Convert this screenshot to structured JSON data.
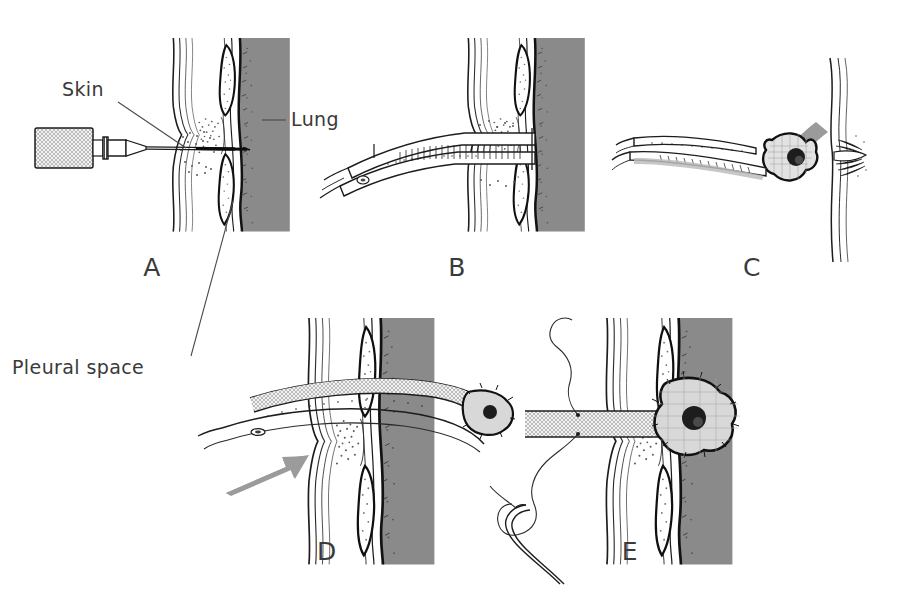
{
  "figure": {
    "background_color": "#ffffff",
    "width": 904,
    "height": 593
  },
  "colors": {
    "lung_fill": "#8a8a8a",
    "arrow_gray": "#9b9b9b",
    "ink": "#1c1c1c",
    "label_text": "#3a3a3a",
    "stipple": "#5a5a5a",
    "tissue_fill": "#d8d8d8",
    "instrument_fill": "#fefefe"
  },
  "labels": [
    {
      "id": "skin",
      "text": "Skin",
      "x": 62,
      "y": 96,
      "anchor": "start"
    },
    {
      "id": "lung",
      "text": "Lung",
      "x": 291,
      "y": 126,
      "anchor": "start"
    },
    {
      "id": "pleural_space",
      "text": "Pleural  space",
      "x": 12,
      "y": 374,
      "anchor": "start"
    }
  ],
  "leader_lines": [
    {
      "id": "skin-leader",
      "from": [
        118,
        102
      ],
      "to": [
        186,
        148
      ]
    },
    {
      "id": "lung-leader",
      "from": [
        262,
        120
      ],
      "to": [
        286,
        120
      ]
    },
    {
      "id": "pleural-leader",
      "from": [
        191,
        356
      ],
      "to": [
        233,
        201
      ]
    }
  ],
  "panels": [
    {
      "id": "A",
      "letter": "A",
      "letter_x": 152,
      "letter_y": 276,
      "caption": "Needle and syringe puncture through skin into pleural space",
      "instrument": "syringe-with-needle"
    },
    {
      "id": "B",
      "letter": "B",
      "letter_x": 457,
      "letter_y": 276,
      "caption": "Curved clamp spreading the intercostal tissue planes",
      "instrument": "curved-clamp"
    },
    {
      "id": "C",
      "letter": "C",
      "letter_x": 752,
      "letter_y": 276,
      "caption": "Clamp grasping the chest tube tip; arrow shows direction of advance",
      "instrument": "clamp-grasping-tube"
    },
    {
      "id": "D",
      "letter": "D",
      "letter_x": 327,
      "letter_y": 560,
      "caption": "Tube advanced through the chest wall into the pleural space",
      "instrument": "tube-advancing"
    },
    {
      "id": "E",
      "letter": "E",
      "letter_x": 630,
      "letter_y": 560,
      "caption": "Tube in final position, secured with suture and needle",
      "instrument": "tube-with-suture"
    }
  ],
  "anatomy_legend": [
    {
      "name": "skin",
      "description": "Outer wavy double-line layer on the left of each chest wall"
    },
    {
      "name": "subcutaneous-tissue",
      "description": "Stippled band between skin and ribs"
    },
    {
      "name": "rib",
      "description": "White lens-shaped ovals above and below the tract"
    },
    {
      "name": "pleural-space",
      "description": "Narrow clear band just outside the lung"
    },
    {
      "name": "lung",
      "description": "Solid gray vertical band on the right"
    }
  ]
}
